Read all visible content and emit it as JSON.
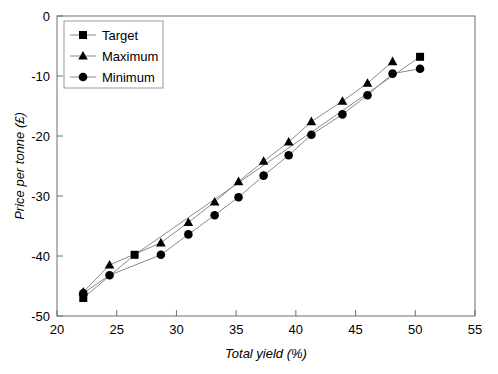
{
  "chart_data": {
    "type": "scatter",
    "title": "",
    "xlabel": "Total yield (%)",
    "ylabel": "Price per tonne (£)",
    "xlim": [
      20,
      55
    ],
    "ylim": [
      -50,
      0
    ],
    "xticks": [
      20,
      25,
      30,
      35,
      40,
      45,
      50,
      55
    ],
    "yticks": [
      0,
      -10,
      -20,
      -30,
      -40,
      -50
    ],
    "xticklabels": [
      "20",
      "25",
      "30",
      "35",
      "40",
      "45",
      "50",
      "55"
    ],
    "yticklabels": [
      "0",
      "-10",
      "-20",
      "-30",
      "-40",
      "-50"
    ],
    "grid": false,
    "legend_position": "upper-left-inside",
    "series": [
      {
        "name": "Target",
        "marker": "square",
        "points": [
          {
            "x": 22.2,
            "y": -47.0
          },
          {
            "x": 26.5,
            "y": -39.8
          },
          {
            "x": 50.4,
            "y": -6.8
          }
        ]
      },
      {
        "name": "Maximum",
        "marker": "triangle",
        "points": [
          {
            "x": 22.2,
            "y": -46.0
          },
          {
            "x": 24.4,
            "y": -41.5
          },
          {
            "x": 28.7,
            "y": -37.8
          },
          {
            "x": 31.0,
            "y": -34.4
          },
          {
            "x": 33.2,
            "y": -31.0
          },
          {
            "x": 35.2,
            "y": -27.6
          },
          {
            "x": 37.3,
            "y": -24.2
          },
          {
            "x": 39.4,
            "y": -21.0
          },
          {
            "x": 41.3,
            "y": -17.6
          },
          {
            "x": 43.9,
            "y": -14.2
          },
          {
            "x": 46.0,
            "y": -11.2
          },
          {
            "x": 48.1,
            "y": -7.6
          }
        ]
      },
      {
        "name": "Minimum",
        "marker": "circle",
        "points": [
          {
            "x": 22.2,
            "y": -46.2
          },
          {
            "x": 24.4,
            "y": -43.2
          },
          {
            "x": 28.7,
            "y": -39.8
          },
          {
            "x": 31.0,
            "y": -36.4
          },
          {
            "x": 33.2,
            "y": -33.2
          },
          {
            "x": 35.2,
            "y": -30.2
          },
          {
            "x": 37.3,
            "y": -26.6
          },
          {
            "x": 39.4,
            "y": -23.2
          },
          {
            "x": 41.3,
            "y": -19.8
          },
          {
            "x": 43.9,
            "y": -16.4
          },
          {
            "x": 46.0,
            "y": -13.2
          },
          {
            "x": 48.1,
            "y": -9.6
          },
          {
            "x": 50.4,
            "y": -8.8
          }
        ]
      }
    ]
  },
  "legend": {
    "entries": [
      {
        "label": "Target",
        "marker": "square"
      },
      {
        "label": "Maximum",
        "marker": "triangle"
      },
      {
        "label": "Minimum",
        "marker": "circle"
      }
    ]
  },
  "colors": {
    "marker": "#000000",
    "line": "#8a8a8a",
    "axis": "#6e6e6e",
    "text": "#000000",
    "background": "#ffffff"
  }
}
